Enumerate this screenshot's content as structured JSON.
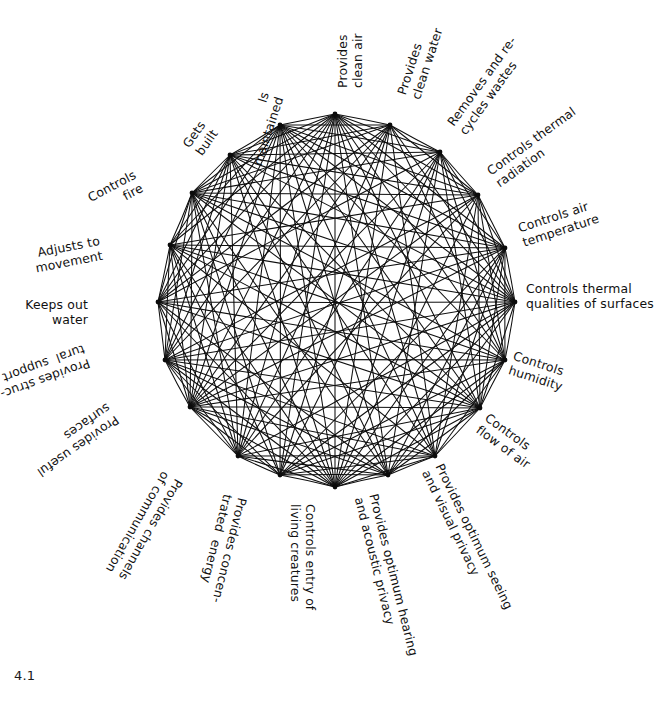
{
  "figure": {
    "caption": "4.1",
    "title_semantic": "building-functions-interaction-network",
    "ink_color": "#0e0e0e",
    "background_color": "#ffffff",
    "node_count": 20,
    "center": {
      "x": 335,
      "y": 300
    },
    "radius": 188
  },
  "nodes": [
    {
      "id": 0,
      "label": "Provides\nclean air",
      "angle_deg": -90,
      "vx": 335,
      "vy": 114,
      "tx": 335,
      "ty": 88,
      "rot": -90,
      "align": "start",
      "anchor": "left-baseline"
    },
    {
      "id": 1,
      "label": "Provides\nclean water",
      "angle_deg": -72,
      "vx": 390,
      "vy": 125,
      "tx": 394,
      "ty": 92,
      "rot": -72,
      "align": "start",
      "anchor": "left-baseline"
    },
    {
      "id": 2,
      "label": "Removes and re-\ncycles wastes",
      "angle_deg": -54,
      "vx": 440,
      "vy": 152,
      "tx": 444,
      "ty": 120,
      "rot": -54,
      "align": "start",
      "anchor": "left-baseline"
    },
    {
      "id": 3,
      "label": "Controls thermal\nradiation",
      "angle_deg": -36,
      "vx": 478,
      "vy": 195,
      "tx": 484,
      "ty": 166,
      "rot": -36,
      "align": "start",
      "anchor": "left-baseline"
    },
    {
      "id": 4,
      "label": "Controls air\ntemperature",
      "angle_deg": -18,
      "vx": 505,
      "vy": 248,
      "tx": 516,
      "ty": 221,
      "rot": -18,
      "align": "start",
      "anchor": "left-baseline"
    },
    {
      "id": 5,
      "label": "Controls thermal\nqualities of surfaces",
      "angle_deg": 0,
      "vx": 515,
      "vy": 302,
      "tx": 526,
      "ty": 281,
      "rot": 0,
      "align": "start",
      "anchor": "left-baseline"
    },
    {
      "id": 6,
      "label": "Controls\nhumidity",
      "angle_deg": 18,
      "vx": 505,
      "vy": 360,
      "tx": 516,
      "ty": 348,
      "rot": 18,
      "align": "start",
      "anchor": "left-baseline"
    },
    {
      "id": 7,
      "label": "Controls\nflow of air",
      "angle_deg": 36,
      "vx": 480,
      "vy": 408,
      "tx": 491,
      "ty": 410,
      "rot": 36,
      "align": "start",
      "anchor": "left-baseline"
    },
    {
      "id": 8,
      "label": "Provides optimum seeing\nand visual privacy",
      "angle_deg": 54,
      "vx": 435,
      "vy": 456,
      "tx": 446,
      "ty": 461,
      "rot": 64,
      "align": "start",
      "anchor": "left-baseline"
    },
    {
      "id": 9,
      "label": "Provides optimum hearing\nand acoustic privacy",
      "angle_deg": 72,
      "vx": 388,
      "vy": 475,
      "tx": 381,
      "ty": 492,
      "rot": 76,
      "align": "start",
      "anchor": "left-baseline"
    },
    {
      "id": 10,
      "label": "Controls entry of\nliving creatures",
      "angle_deg": 90,
      "vx": 335,
      "vy": 487,
      "tx": 318,
      "ty": 504,
      "rot": 90,
      "align": "start",
      "anchor": "left-baseline"
    },
    {
      "id": 11,
      "label": "Provides concen-\ntrated  energy",
      "angle_deg": 108,
      "vx": 280,
      "vy": 475,
      "tx": 250,
      "ty": 500,
      "rot": 104,
      "align": "start",
      "anchor": "left-baseline"
    },
    {
      "id": 12,
      "label": "Provides channels\nof communication",
      "angle_deg": 126,
      "vx": 238,
      "vy": 456,
      "tx": 186,
      "ty": 484,
      "rot": 120,
      "align": "start",
      "anchor": "left-baseline"
    },
    {
      "id": 13,
      "label": "Provides useful\nsurfaces",
      "angle_deg": 144,
      "vx": 190,
      "vy": 407,
      "tx": 122,
      "ty": 425,
      "rot": 145,
      "align": "start",
      "anchor": "left-baseline"
    },
    {
      "id": 14,
      "label": "Provides struc-\ntural  support",
      "angle_deg": 162,
      "vx": 165,
      "vy": 360,
      "tx": 92,
      "ty": 370,
      "rot": 160,
      "align": "start",
      "anchor": "left-baseline"
    },
    {
      "id": 15,
      "label": "Keeps out\nwater",
      "angle_deg": 180,
      "vx": 158,
      "vy": 302,
      "tx": 88,
      "ty": 297,
      "rot": 0,
      "align": "end",
      "anchor": "right-baseline"
    },
    {
      "id": 16,
      "label": "Adjusts to\nmovement",
      "angle_deg": 198,
      "vx": 170,
      "vy": 245,
      "tx": 98,
      "ty": 233,
      "rot": -11,
      "align": "end",
      "anchor": "right-baseline"
    },
    {
      "id": 17,
      "label": "Controls\nfire",
      "angle_deg": 216,
      "vx": 192,
      "vy": 193,
      "tx": 131,
      "ty": 167,
      "rot": -28,
      "align": "end",
      "anchor": "right-baseline"
    },
    {
      "id": 18,
      "label": "Gets\nbuilt",
      "angle_deg": 234,
      "vx": 230,
      "vy": 155,
      "tx": 196,
      "ty": 118,
      "rot": -55,
      "align": "end",
      "anchor": "right-baseline"
    },
    {
      "id": 19,
      "label": "Is\nmaintained",
      "angle_deg": 252,
      "vx": 280,
      "vy": 125,
      "tx": 258,
      "ty": 90,
      "rot": -72,
      "align": "end",
      "anchor": "right-baseline"
    }
  ],
  "edges": [
    [
      0,
      1
    ],
    [
      0,
      2
    ],
    [
      0,
      3
    ],
    [
      0,
      4
    ],
    [
      0,
      5
    ],
    [
      0,
      6
    ],
    [
      0,
      7
    ],
    [
      0,
      8
    ],
    [
      0,
      9
    ],
    [
      0,
      10
    ],
    [
      0,
      11
    ],
    [
      0,
      12
    ],
    [
      0,
      13
    ],
    [
      0,
      14
    ],
    [
      0,
      15
    ],
    [
      0,
      16
    ],
    [
      0,
      17
    ],
    [
      0,
      18
    ],
    [
      0,
      19
    ],
    [
      1,
      2
    ],
    [
      1,
      3
    ],
    [
      1,
      5
    ],
    [
      1,
      6
    ],
    [
      1,
      8
    ],
    [
      1,
      10
    ],
    [
      1,
      11
    ],
    [
      1,
      12
    ],
    [
      1,
      13
    ],
    [
      1,
      14
    ],
    [
      1,
      15
    ],
    [
      1,
      17
    ],
    [
      1,
      18
    ],
    [
      1,
      19
    ],
    [
      2,
      3
    ],
    [
      2,
      4
    ],
    [
      2,
      5
    ],
    [
      2,
      6
    ],
    [
      2,
      7
    ],
    [
      2,
      9
    ],
    [
      2,
      10
    ],
    [
      2,
      11
    ],
    [
      2,
      12
    ],
    [
      2,
      13
    ],
    [
      2,
      15
    ],
    [
      2,
      17
    ],
    [
      2,
      18
    ],
    [
      2,
      19
    ],
    [
      3,
      4
    ],
    [
      3,
      5
    ],
    [
      3,
      6
    ],
    [
      3,
      7
    ],
    [
      3,
      8
    ],
    [
      3,
      10
    ],
    [
      3,
      12
    ],
    [
      3,
      13
    ],
    [
      3,
      14
    ],
    [
      3,
      16
    ],
    [
      3,
      17
    ],
    [
      3,
      18
    ],
    [
      3,
      19
    ],
    [
      4,
      5
    ],
    [
      4,
      6
    ],
    [
      4,
      7
    ],
    [
      4,
      8
    ],
    [
      4,
      9
    ],
    [
      4,
      10
    ],
    [
      4,
      11
    ],
    [
      4,
      13
    ],
    [
      4,
      14
    ],
    [
      4,
      15
    ],
    [
      4,
      16
    ],
    [
      4,
      17
    ],
    [
      4,
      18
    ],
    [
      4,
      19
    ],
    [
      5,
      6
    ],
    [
      5,
      7
    ],
    [
      5,
      9
    ],
    [
      5,
      10
    ],
    [
      5,
      11
    ],
    [
      5,
      12
    ],
    [
      5,
      13
    ],
    [
      5,
      14
    ],
    [
      5,
      15
    ],
    [
      5,
      16
    ],
    [
      5,
      17
    ],
    [
      5,
      18
    ],
    [
      5,
      19
    ],
    [
      6,
      7
    ],
    [
      6,
      8
    ],
    [
      6,
      9
    ],
    [
      6,
      10
    ],
    [
      6,
      11
    ],
    [
      6,
      13
    ],
    [
      6,
      14
    ],
    [
      6,
      15
    ],
    [
      6,
      16
    ],
    [
      6,
      17
    ],
    [
      6,
      19
    ],
    [
      7,
      8
    ],
    [
      7,
      9
    ],
    [
      7,
      10
    ],
    [
      7,
      11
    ],
    [
      7,
      12
    ],
    [
      7,
      13
    ],
    [
      7,
      14
    ],
    [
      7,
      15
    ],
    [
      7,
      16
    ],
    [
      7,
      17
    ],
    [
      7,
      18
    ],
    [
      7,
      19
    ],
    [
      8,
      9
    ],
    [
      8,
      10
    ],
    [
      8,
      11
    ],
    [
      8,
      12
    ],
    [
      8,
      13
    ],
    [
      8,
      14
    ],
    [
      8,
      16
    ],
    [
      8,
      18
    ],
    [
      8,
      19
    ],
    [
      9,
      10
    ],
    [
      9,
      11
    ],
    [
      9,
      12
    ],
    [
      9,
      13
    ],
    [
      9,
      14
    ],
    [
      9,
      15
    ],
    [
      9,
      17
    ],
    [
      9,
      18
    ],
    [
      9,
      19
    ],
    [
      10,
      11
    ],
    [
      10,
      12
    ],
    [
      10,
      13
    ],
    [
      10,
      14
    ],
    [
      10,
      15
    ],
    [
      10,
      16
    ],
    [
      10,
      17
    ],
    [
      10,
      18
    ],
    [
      10,
      19
    ],
    [
      11,
      12
    ],
    [
      11,
      13
    ],
    [
      11,
      14
    ],
    [
      11,
      16
    ],
    [
      11,
      17
    ],
    [
      11,
      19
    ],
    [
      12,
      13
    ],
    [
      12,
      14
    ],
    [
      12,
      15
    ],
    [
      12,
      16
    ],
    [
      12,
      17
    ],
    [
      12,
      18
    ],
    [
      12,
      19
    ],
    [
      13,
      14
    ],
    [
      13,
      15
    ],
    [
      13,
      16
    ],
    [
      13,
      17
    ],
    [
      13,
      18
    ],
    [
      13,
      19
    ],
    [
      14,
      15
    ],
    [
      14,
      16
    ],
    [
      14,
      17
    ],
    [
      14,
      18
    ],
    [
      14,
      19
    ],
    [
      15,
      16
    ],
    [
      15,
      17
    ],
    [
      15,
      18
    ],
    [
      15,
      19
    ],
    [
      16,
      17
    ],
    [
      16,
      18
    ],
    [
      16,
      19
    ],
    [
      17,
      18
    ],
    [
      17,
      19
    ],
    [
      18,
      19
    ]
  ]
}
